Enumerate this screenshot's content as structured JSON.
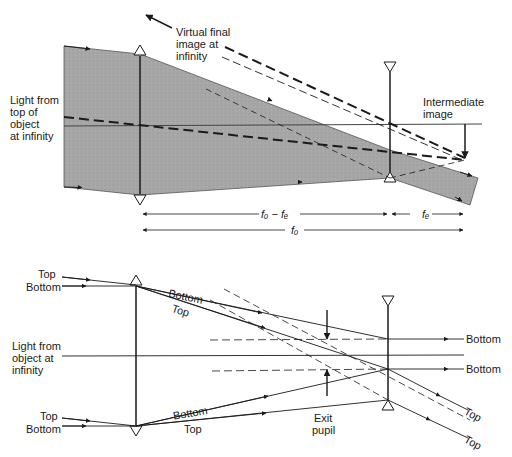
{
  "figure": {
    "top_diagram": {
      "title": "Telescope ray diagram with shaded beam",
      "labels": {
        "virtual_image": [
          "Virtual final",
          "image at",
          "infinity"
        ],
        "light_source": [
          "Light from",
          "top of",
          "object",
          "at infinity"
        ],
        "intermediate_image": [
          "Intermediate",
          "image"
        ]
      },
      "dimensions": {
        "fo_minus_fe": "fₒ − fₑ",
        "fe": "fₑ",
        "fo": "fₒ"
      }
    },
    "bottom_diagram": {
      "title": "Telescope exit pupil ray diagram",
      "labels": {
        "upper_left_top": "Top",
        "upper_left_bottom": "Bottom",
        "upper_mid_bottom": "Bottom",
        "upper_mid_top": "Top",
        "light_source": [
          "Light from",
          "object at",
          "infinity"
        ],
        "lower_left_top": "Top",
        "lower_left_bottom": "Bottom",
        "lower_mid_bottom": "Bottom",
        "lower_mid_top": "Top",
        "right_bottom_1": "Bottom",
        "right_bottom_2": "Bottom",
        "right_top_1": "Top",
        "right_top_2": "Top",
        "exit_pupil": [
          "Exit",
          "pupil"
        ]
      }
    },
    "colors": {
      "shading": "#a9a9a9",
      "line": "#1a1a1a",
      "background": "#ffffff"
    }
  }
}
